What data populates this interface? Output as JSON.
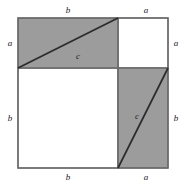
{
  "figure": {
    "type": "geometric-diagram",
    "colors": {
      "shaded_fill": "#9c9c9c",
      "unshaded_fill": "#ffffff",
      "stroke": "#4a4a4a",
      "diagonal_stroke": "#2a2a2a",
      "label_color": "#1a1a1a",
      "background": "#ffffff"
    },
    "outer_square": {
      "x": 18,
      "y": 18,
      "size": 150,
      "side_label": "a + b"
    },
    "split": {
      "vertical_x": 118,
      "horizontal_y": 68
    },
    "regions": [
      {
        "name": "top-left-rectangle",
        "shaded": true,
        "x": 18,
        "y": 18,
        "width": 100,
        "height": 50,
        "width_label": "b",
        "height_label": "a",
        "diagonal_label": "c"
      },
      {
        "name": "top-right-square",
        "shaded": false,
        "x": 118,
        "y": 18,
        "width": 50,
        "height": 50,
        "width_label": "a",
        "height_label": "a"
      },
      {
        "name": "bottom-left-square",
        "shaded": false,
        "x": 18,
        "y": 68,
        "width": 100,
        "height": 100,
        "width_label": "b",
        "height_label": "b"
      },
      {
        "name": "bottom-right-rectangle",
        "shaded": true,
        "x": 118,
        "y": 68,
        "width": 50,
        "height": 100,
        "width_label": "a",
        "height_label": "b",
        "diagonal_label": "c"
      }
    ],
    "labels": {
      "top_left_side": "b",
      "top_right_side": "a",
      "left_upper_side": "a",
      "left_lower_side": "b",
      "right_upper_side": "a",
      "right_lower_side": "b",
      "bottom_left_side": "b",
      "bottom_right_side": "a",
      "upper_hypotenuse": "c",
      "lower_hypotenuse": "c"
    }
  }
}
